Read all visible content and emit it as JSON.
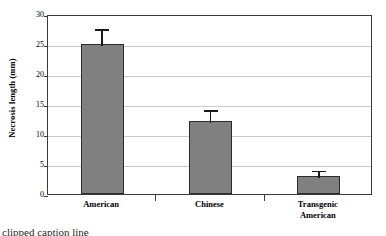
{
  "chart_data": {
    "type": "bar",
    "title": "",
    "xlabel": "",
    "ylabel": "Necrosis length (mm)",
    "categories": [
      "American",
      "Chinese",
      "Transgenic American"
    ],
    "category_lines": [
      [
        "American"
      ],
      [
        "Chinese"
      ],
      [
        "Transgenic",
        "American"
      ]
    ],
    "values": [
      25.0,
      12.2,
      3.0
    ],
    "errors": [
      2.8,
      2.1,
      1.2
    ],
    "error_type": "upper-only",
    "ylim": [
      0,
      30
    ],
    "yticks": [
      0,
      5,
      10,
      15,
      20,
      25,
      30
    ],
    "ytick_labels": [
      "0",
      "5",
      "10",
      "15",
      "20",
      "25",
      "30"
    ],
    "grid": "horizontal",
    "legend": "none",
    "bar_color": "#808080",
    "bar_edge_color": "#2b2b2b",
    "gridline_color": "#c9c9c9",
    "axis_color": "#3a3a3a",
    "errorbar_color": "#1a1a1a"
  },
  "caption": {
    "text": "clipped caption line"
  }
}
